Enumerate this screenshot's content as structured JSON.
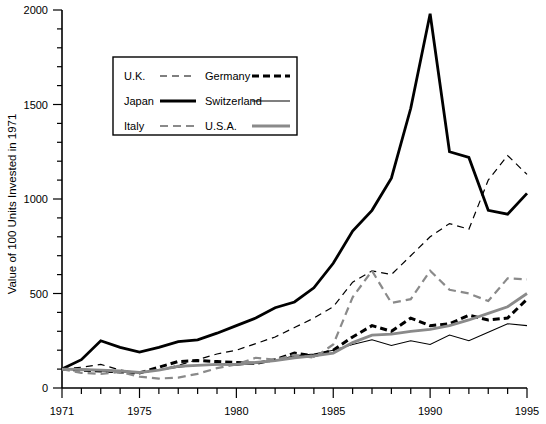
{
  "chart_data": {
    "type": "line",
    "title": "",
    "subtitle": "",
    "xlabel": "",
    "ylabel": "Value of 100 Units Invested in 1971",
    "xlim": [
      1971,
      1995
    ],
    "ylim": [
      0,
      2000
    ],
    "grid": false,
    "legend_position": "top-left-inside",
    "y_ticks": [
      0,
      500,
      1000,
      1500,
      2000
    ],
    "y_tick_labels": [
      "0",
      "500",
      "1000",
      "1500",
      "2000"
    ],
    "y_minor_tick_step": 100,
    "x_ticks": [
      1971,
      1975,
      1980,
      1985,
      1990,
      1995
    ],
    "x_tick_labels": [
      "1971",
      "1975",
      "1980",
      "1985",
      "1990",
      "1995"
    ],
    "x_minor_tick_step": 1,
    "x": [
      1971,
      1972,
      1973,
      1974,
      1975,
      1976,
      1977,
      1978,
      1979,
      1980,
      1981,
      1982,
      1983,
      1984,
      1985,
      1986,
      1987,
      1988,
      1989,
      1990,
      1991,
      1992,
      1993,
      1994,
      1995
    ],
    "series": [
      {
        "name": "U.K.",
        "color": "#000000",
        "style": "dashed-thin",
        "values": [
          100,
          110,
          125,
          95,
          80,
          95,
          120,
          150,
          180,
          200,
          235,
          270,
          320,
          370,
          430,
          560,
          620,
          600,
          700,
          800,
          870,
          840,
          1100,
          1230,
          1130
        ]
      },
      {
        "name": "Germany",
        "color": "#000000",
        "style": "dashed-thick",
        "values": [
          100,
          95,
          90,
          85,
          80,
          110,
          140,
          145,
          140,
          135,
          130,
          150,
          185,
          170,
          200,
          270,
          330,
          300,
          370,
          330,
          340,
          385,
          360,
          370,
          470
        ]
      },
      {
        "name": "Japan",
        "color": "#000000",
        "style": "solid-thick",
        "values": [
          100,
          150,
          250,
          215,
          190,
          215,
          245,
          255,
          290,
          330,
          370,
          425,
          455,
          530,
          660,
          830,
          940,
          1110,
          1480,
          1980,
          1250,
          1220,
          940,
          920,
          1030
        ]
      },
      {
        "name": "Switzerland",
        "color": "#000000",
        "style": "solid-thin",
        "values": [
          100,
          95,
          90,
          85,
          80,
          95,
          110,
          120,
          125,
          120,
          130,
          145,
          170,
          180,
          200,
          230,
          255,
          225,
          250,
          230,
          280,
          250,
          295,
          340,
          330
        ]
      },
      {
        "name": "Italy",
        "color": "#808080",
        "style": "dashed-gray",
        "values": [
          100,
          80,
          75,
          85,
          60,
          50,
          55,
          75,
          105,
          125,
          160,
          150,
          175,
          160,
          230,
          480,
          620,
          450,
          470,
          620,
          520,
          500,
          460,
          580,
          575
        ]
      },
      {
        "name": "U.S.A.",
        "color": "#808080",
        "style": "solid-gray-thick",
        "values": [
          100,
          98,
          95,
          90,
          82,
          95,
          115,
          120,
          125,
          125,
          135,
          145,
          160,
          170,
          185,
          240,
          280,
          285,
          300,
          310,
          330,
          360,
          395,
          430,
          500
        ]
      }
    ]
  },
  "axes": {
    "y_title": "Value of 100 Units Invested in 1971",
    "y_tick_labels": [
      "0",
      "500",
      "1000",
      "1500",
      "2000"
    ],
    "x_tick_labels": [
      "1971",
      "1975",
      "1980",
      "1985",
      "1990",
      "1995"
    ]
  },
  "legend": {
    "entries": [
      {
        "label": "U.K.",
        "style": "dashed-thin",
        "color": "#000000"
      },
      {
        "label": "Germany",
        "style": "dashed-thick",
        "color": "#000000"
      },
      {
        "label": "Japan",
        "style": "solid-thick",
        "color": "#000000"
      },
      {
        "label": "Switzerland",
        "style": "solid-thin",
        "color": "#808080"
      },
      {
        "label": "Italy",
        "style": "dashed-gray",
        "color": "#808080"
      },
      {
        "label": "U.S.A.",
        "style": "solid-gray-thick",
        "color": "#808080"
      }
    ]
  }
}
